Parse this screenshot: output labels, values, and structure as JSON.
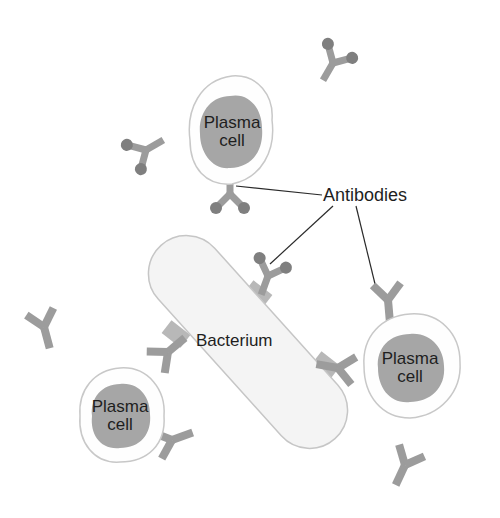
{
  "diagram": {
    "colors": {
      "background": "#ffffff",
      "cell_membrane_fill": "#fefefe",
      "cell_membrane_stroke": "#c8c8c8",
      "nucleus_fill": "#a6a6a6",
      "bacterium_fill": "#f4f4f4",
      "bacterium_stroke": "#c6c6c6",
      "antibody_arm": "#9c9c9c",
      "antibody_tip": "#7f7f7f",
      "antigen_patch": "#b8b8b8",
      "leader_line": "#2a2a2a",
      "text": "#1e1e1e"
    },
    "plasma_cells": [
      {
        "id": "top",
        "line1": "Plasma",
        "line2": "cell"
      },
      {
        "id": "right",
        "line1": "Plasma",
        "line2": "cell"
      },
      {
        "id": "bottom-left",
        "line1": "Plasma",
        "line2": "cell"
      }
    ],
    "bacterium": {
      "label": "Bacterium"
    },
    "callout": {
      "label": "Antibodies"
    }
  }
}
